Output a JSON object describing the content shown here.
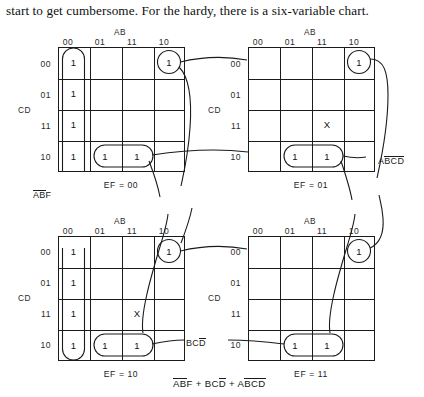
{
  "caption": "start to get cumbersome. For the hardy, there is a six-variable chart.",
  "maps": [
    {
      "id": "map-ef-00",
      "ab_title": "AB",
      "cd_title": "CD",
      "col_headers": [
        "00",
        "01",
        "11",
        "10"
      ],
      "row_headers": [
        "00",
        "01",
        "11",
        "10"
      ],
      "footer": "EF = 00",
      "cells": [
        [
          "1",
          "",
          "",
          "1"
        ],
        [
          "1",
          "",
          "",
          ""
        ],
        [
          "1",
          "",
          "",
          ""
        ],
        [
          "1",
          "1",
          "1",
          ""
        ]
      ]
    },
    {
      "id": "map-ef-01",
      "ab_title": "AB",
      "cd_title": "CD",
      "col_headers": [
        "00",
        "01",
        "11",
        "10"
      ],
      "row_headers": [
        "00",
        "01",
        "11",
        "10"
      ],
      "footer": "EF = 01",
      "cells": [
        [
          "",
          "",
          "",
          "1"
        ],
        [
          "",
          "",
          "",
          ""
        ],
        [
          "",
          "",
          "X",
          ""
        ],
        [
          "",
          "1",
          "1",
          ""
        ]
      ]
    },
    {
      "id": "map-ef-10",
      "ab_title": "AB",
      "cd_title": "CD",
      "col_headers": [
        "00",
        "01",
        "11",
        "10"
      ],
      "row_headers": [
        "00",
        "01",
        "11",
        "10"
      ],
      "footer": "EF = 10",
      "cells": [
        [
          "1",
          "",
          "",
          "1"
        ],
        [
          "1",
          "",
          "",
          ""
        ],
        [
          "1",
          "",
          "X",
          ""
        ],
        [
          "1",
          "1",
          "1",
          ""
        ]
      ]
    },
    {
      "id": "map-ef-11",
      "ab_title": "AB",
      "cd_title": "CD",
      "col_headers": [
        "00",
        "01",
        "11",
        "10"
      ],
      "row_headers": [
        "00",
        "01",
        "11",
        "10"
      ],
      "footer": "EF = 11",
      "cells": [
        [
          "",
          "",
          "",
          "1"
        ],
        [
          "",
          "",
          "",
          ""
        ],
        [
          "",
          "",
          "",
          ""
        ],
        [
          "",
          "1",
          "1",
          ""
        ]
      ]
    }
  ],
  "annotations": {
    "abf": {
      "pre": "",
      "barred": "AB",
      "post": "F"
    },
    "abcd_right": {
      "pre": "A",
      "barred": "BCD",
      "post": ""
    },
    "bcd": {
      "pre": "BC",
      "barred": "D",
      "post": ""
    }
  },
  "equation": {
    "t1_bar": "AB",
    "t1_rest": "F",
    "plus1": " + ",
    "t2_rest": "BC",
    "t2_bar": "D",
    "plus2": " + ",
    "t3_pre": "A",
    "t3_bar": "BCD",
    "t3_post": ""
  },
  "colors": {
    "ink": "#1b1b1b",
    "paper": "#ffffff"
  }
}
